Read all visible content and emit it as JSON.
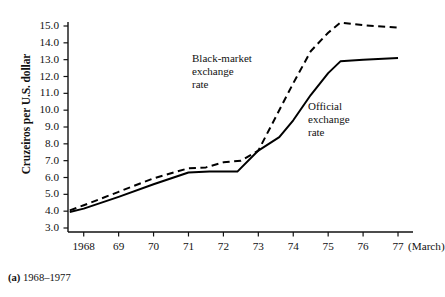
{
  "figure": {
    "caption_marker": "(a)",
    "caption_text": "1968–1977"
  },
  "chart_data": {
    "type": "line",
    "title": "",
    "subtitle": "",
    "xlabel": "",
    "ylabel": "Cruzeiros per U.S. dollar",
    "x_unit_note": "(March)",
    "xlim": [
      1967.55,
      1977.2
    ],
    "ylim": [
      2.55,
      15.6
    ],
    "grid": false,
    "legend_position": "inline-annotations",
    "x": [
      1968,
      1969,
      1970,
      1971,
      1972,
      1973,
      1974,
      1975,
      1976,
      1977
    ],
    "categories": [
      "1968",
      "69",
      "70",
      "71",
      "72",
      "73",
      "74",
      "75",
      "76",
      "77"
    ],
    "ytick_labels": [
      "15.0",
      "14.0",
      "13.0",
      "12.0",
      "11.0",
      "10.0",
      "9.0",
      "8.0",
      "7.0",
      "6.0",
      "5.0",
      "4.0",
      "3.0"
    ],
    "ytick_values": [
      15.0,
      14.0,
      13.0,
      12.0,
      11.0,
      10.0,
      9.0,
      8.0,
      7.0,
      6.0,
      5.0,
      4.0,
      3.0
    ],
    "series": [
      {
        "name": "Black-market exchange rate",
        "style": "dashed",
        "color": "#000000",
        "annotation_lines": [
          "Black-market",
          "exchange",
          "rate"
        ],
        "points": [
          {
            "x": 1967.6,
            "y": 4.05
          },
          {
            "x": 1968.0,
            "y": 4.35
          },
          {
            "x": 1969.0,
            "y": 5.15
          },
          {
            "x": 1970.0,
            "y": 5.95
          },
          {
            "x": 1971.0,
            "y": 6.55
          },
          {
            "x": 1971.5,
            "y": 6.6
          },
          {
            "x": 1972.0,
            "y": 6.9
          },
          {
            "x": 1972.5,
            "y": 7.0
          },
          {
            "x": 1973.0,
            "y": 7.6
          },
          {
            "x": 1973.5,
            "y": 9.6
          },
          {
            "x": 1974.0,
            "y": 11.6
          },
          {
            "x": 1974.5,
            "y": 13.5
          },
          {
            "x": 1975.0,
            "y": 14.6
          },
          {
            "x": 1975.35,
            "y": 15.2
          },
          {
            "x": 1976.0,
            "y": 15.05
          },
          {
            "x": 1977.0,
            "y": 14.9
          }
        ]
      },
      {
        "name": "Official exchange rate",
        "style": "solid",
        "color": "#000000",
        "annotation_lines": [
          "Official",
          "exchange",
          "rate"
        ],
        "points": [
          {
            "x": 1967.6,
            "y": 3.95
          },
          {
            "x": 1968.0,
            "y": 4.15
          },
          {
            "x": 1969.0,
            "y": 4.85
          },
          {
            "x": 1970.0,
            "y": 5.6
          },
          {
            "x": 1971.0,
            "y": 6.3
          },
          {
            "x": 1971.6,
            "y": 6.35
          },
          {
            "x": 1972.4,
            "y": 6.35
          },
          {
            "x": 1973.0,
            "y": 7.6
          },
          {
            "x": 1973.6,
            "y": 8.4
          },
          {
            "x": 1974.0,
            "y": 9.4
          },
          {
            "x": 1974.5,
            "y": 10.9
          },
          {
            "x": 1975.0,
            "y": 12.2
          },
          {
            "x": 1975.35,
            "y": 12.9
          },
          {
            "x": 1976.0,
            "y": 13.0
          },
          {
            "x": 1977.0,
            "y": 13.1
          }
        ]
      }
    ]
  }
}
